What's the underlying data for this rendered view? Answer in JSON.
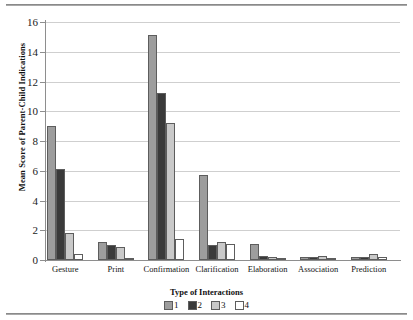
{
  "chart_data": {
    "type": "bar",
    "title": "",
    "xlabel": "Type of Interactions",
    "ylabel": "Mean Score of Parent-Child Indications",
    "categories": [
      "Gesture",
      "Print",
      "Confirmation",
      "Clarification",
      "Elaboration",
      "Association",
      "Prediction"
    ],
    "series": [
      {
        "name": "1",
        "color": "#9d9d9d",
        "values": [
          9.0,
          1.2,
          15.1,
          5.7,
          1.1,
          0.2,
          0.2
        ]
      },
      {
        "name": "2",
        "color": "#3a3a3a",
        "values": [
          6.1,
          1.0,
          11.2,
          1.0,
          0.3,
          0.2,
          0.2
        ]
      },
      {
        "name": "3",
        "color": "#c9c9c9",
        "values": [
          1.8,
          0.9,
          9.2,
          1.2,
          0.2,
          0.3,
          0.4
        ]
      },
      {
        "name": "4",
        "color": "#ffffff",
        "values": [
          0.4,
          0.1,
          1.4,
          1.1,
          0.1,
          0.1,
          0.2
        ]
      }
    ],
    "ylim": [
      0,
      16
    ],
    "yticks": [
      0,
      2,
      4,
      6,
      8,
      10,
      12,
      14,
      16
    ],
    "grid": true,
    "legend_position": "bottom",
    "legend_entries": [
      "1",
      "2",
      "3",
      "4"
    ]
  }
}
